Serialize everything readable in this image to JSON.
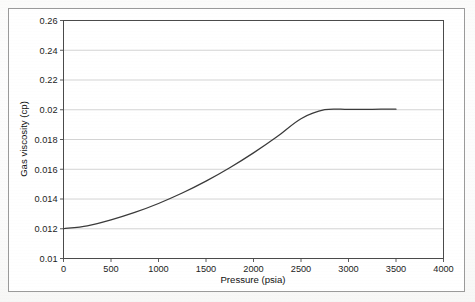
{
  "figure": {
    "background_color": "#fdfdfd",
    "frame_color": "#9a9a9a",
    "plot_border_color": "#4a4a4a",
    "gridline_color": "#c9c9c9",
    "curve_color": "#3a3a3a"
  },
  "chart_data": {
    "type": "line",
    "title": "",
    "xlabel": "Pressure (psia)",
    "ylabel": "Gas viscosity (cp)",
    "xlim": [
      0,
      4000
    ],
    "ylim": [
      0.01,
      0.26
    ],
    "grid": true,
    "legend": false,
    "xticks": [
      0,
      500,
      1000,
      1500,
      2000,
      2500,
      3000,
      3500,
      4000
    ],
    "xticklabels": [
      "0",
      "500",
      "1000",
      "1500",
      "2000",
      "2500",
      "3000",
      "3500",
      "4000"
    ],
    "yticks": [
      0.01,
      0.012,
      0.014,
      0.016,
      0.018,
      0.02,
      0.22,
      0.24,
      0.26
    ],
    "yticklabels": [
      "0.01",
      "0.012",
      "0.014",
      "0.016",
      "0.018",
      "0.02",
      "0.22",
      "0.24",
      "0.26"
    ],
    "series": [
      {
        "name": "Gas viscosity",
        "x": [
          0,
          250,
          500,
          750,
          1000,
          1250,
          1500,
          1750,
          2000,
          2250,
          2500,
          2750,
          3000,
          3250,
          3500
        ],
        "y": [
          0.012,
          0.0122,
          0.0126,
          0.0131,
          0.0137,
          0.0144,
          0.0152,
          0.0161,
          0.0171,
          0.0182,
          0.0194,
          0.0206,
          0.0219,
          0.0231,
          0.0242
        ]
      }
    ],
    "annotations": []
  }
}
